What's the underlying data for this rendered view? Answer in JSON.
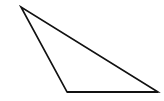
{
  "diagram": {
    "shape": "triangle",
    "kind": "obtuse",
    "stroke_color": "#111111",
    "fill_color": "#ffffff",
    "edges": [
      {
        "name": "left-side",
        "from": "top-vertex",
        "to": "bottom-left-vertex"
      },
      {
        "name": "hypotenuse",
        "from": "top-vertex",
        "to": "bottom-right-vertex"
      },
      {
        "name": "base",
        "from": "bottom-left-vertex",
        "to": "bottom-right-vertex"
      }
    ]
  }
}
